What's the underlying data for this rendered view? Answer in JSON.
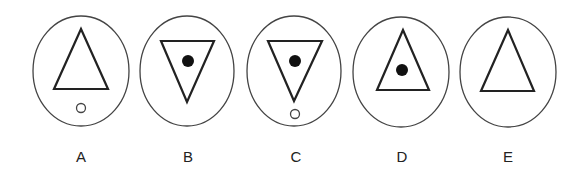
{
  "figure": {
    "options": [
      {
        "label": "A",
        "triangle": "up",
        "inner_dot": false,
        "small_circle_below": true
      },
      {
        "label": "B",
        "triangle": "down",
        "inner_dot": true,
        "small_circle_below": false
      },
      {
        "label": "C",
        "triangle": "down",
        "inner_dot": true,
        "small_circle_below": true
      },
      {
        "label": "D",
        "triangle": "up",
        "inner_dot": true,
        "small_circle_below": false
      },
      {
        "label": "E",
        "triangle": "up",
        "inner_dot": false,
        "small_circle_below": false
      }
    ],
    "colors": {
      "stroke": "#222222",
      "ellipse_stroke": "#444444",
      "background": "#ffffff"
    }
  }
}
